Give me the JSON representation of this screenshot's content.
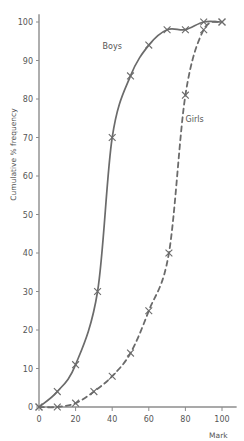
{
  "chart_data": {
    "type": "line",
    "title": "",
    "subtitle": "",
    "xlabel": "Mark",
    "ylabel": "Cumulative % frequency",
    "xlim": [
      0,
      108
    ],
    "ylim": [
      0,
      102
    ],
    "xticks": [
      0,
      20,
      40,
      60,
      80,
      100
    ],
    "yticks": [
      0,
      10,
      20,
      30,
      40,
      50,
      60,
      70,
      80,
      90,
      100
    ],
    "grid": false,
    "legend": "inline-annotations",
    "marker": "x-cross",
    "line_color": "#6b6b6b",
    "axis_color": "#8c8c8c",
    "text_color": "#555555",
    "background": "#ffffff",
    "series": [
      {
        "name": "Boys",
        "style": "solid",
        "label_x": 40,
        "label_y": 93,
        "points": [
          {
            "x": 0,
            "y": 0
          },
          {
            "x": 10,
            "y": 4
          },
          {
            "x": 20,
            "y": 11
          },
          {
            "x": 32,
            "y": 30
          },
          {
            "x": 40,
            "y": 70
          },
          {
            "x": 50,
            "y": 86
          },
          {
            "x": 60,
            "y": 94
          },
          {
            "x": 70,
            "y": 98
          },
          {
            "x": 80,
            "y": 98
          },
          {
            "x": 90,
            "y": 100
          },
          {
            "x": 100,
            "y": 100
          }
        ]
      },
      {
        "name": "Girls",
        "style": "dashed",
        "label_x": 85,
        "label_y": 74,
        "points": [
          {
            "x": 0,
            "y": 0
          },
          {
            "x": 10,
            "y": 0
          },
          {
            "x": 20,
            "y": 1
          },
          {
            "x": 30,
            "y": 4
          },
          {
            "x": 40,
            "y": 8
          },
          {
            "x": 50,
            "y": 14
          },
          {
            "x": 60,
            "y": 25
          },
          {
            "x": 71,
            "y": 40
          },
          {
            "x": 80,
            "y": 81
          },
          {
            "x": 90,
            "y": 98
          },
          {
            "x": 100,
            "y": 100
          }
        ]
      }
    ]
  }
}
